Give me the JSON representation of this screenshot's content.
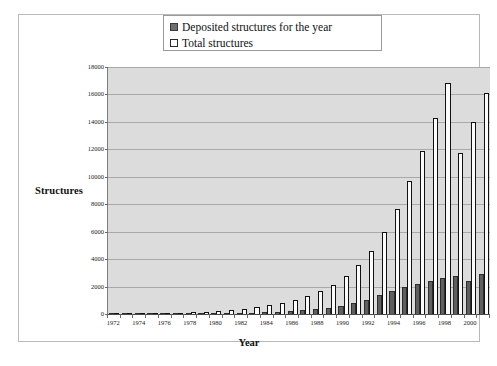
{
  "chart_data": {
    "type": "bar",
    "title": "",
    "xlabel": "Year",
    "ylabel": "Structures",
    "ylim": [
      0,
      18000
    ],
    "ytick_step": 2000,
    "yticks": [
      "0",
      "2000",
      "4000",
      "6000",
      "8000",
      "10000",
      "12000",
      "14000",
      "16000",
      "18000"
    ],
    "grid": true,
    "legend_position": "top-center",
    "categories": [
      "1972",
      "1973",
      "1974",
      "1975",
      "1976",
      "1977",
      "1978",
      "1979",
      "1980",
      "1981",
      "1982",
      "1983",
      "1984",
      "1985",
      "1986",
      "1987",
      "1988",
      "1989",
      "1990",
      "1991",
      "1992",
      "1993",
      "1994",
      "1995",
      "1996",
      "1997",
      "1998",
      "1999",
      "2000",
      "2001"
    ],
    "xtick_labels": [
      "1972",
      "1974",
      "1976",
      "1978",
      "1980",
      "1982",
      "1984",
      "1986",
      "1988",
      "1990",
      "1992",
      "1994",
      "1996",
      "1998",
      "2000"
    ],
    "series": [
      {
        "name": "Deposited structures for the year",
        "color": "#5f5f5f",
        "values": [
          10,
          8,
          12,
          15,
          22,
          28,
          35,
          42,
          55,
          68,
          85,
          110,
          140,
          175,
          220,
          280,
          360,
          470,
          620,
          810,
          1050,
          1350,
          1700,
          2000,
          2200,
          2400,
          2600,
          2800,
          2400,
          2900
        ]
      },
      {
        "name": "Total structures",
        "color": "#fbfbfb",
        "values": [
          15,
          23,
          35,
          50,
          72,
          100,
          135,
          177,
          232,
          300,
          385,
          495,
          635,
          810,
          1030,
          1310,
          1670,
          2140,
          2760,
          3570,
          4620,
          5970,
          7670,
          9670,
          11870,
          14270,
          16870,
          11700,
          14000,
          16100
        ]
      }
    ]
  },
  "legend": {
    "items": [
      {
        "label": "Deposited structures for the year",
        "swatch": "filled-gray-swatch"
      },
      {
        "label": "Total structures",
        "swatch": "open-white-swatch"
      }
    ]
  },
  "axes": {
    "y_title": "Structures",
    "x_title": "Year"
  }
}
